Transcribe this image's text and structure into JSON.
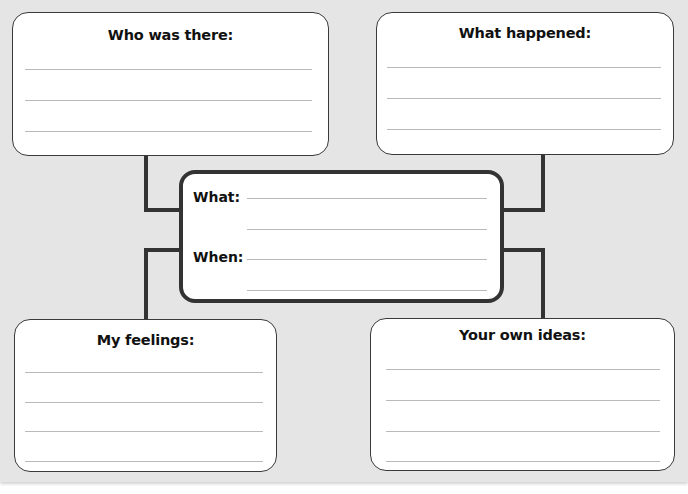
{
  "diagram": {
    "type": "graphic-organizer",
    "colors": {
      "background": "#e5e5e5",
      "box_fill": "#ffffff",
      "border": "#333333",
      "writing_line": "#b9b9b9"
    },
    "center": {
      "what_label": "What:",
      "when_label": "When:",
      "lines_per_label": 2
    },
    "boxes": [
      {
        "position": "top-left",
        "title": "Who was there:",
        "lines": 3
      },
      {
        "position": "top-right",
        "title": "What happened:",
        "lines": 3
      },
      {
        "position": "bottom-left",
        "title": "My feelings:",
        "lines": 4
      },
      {
        "position": "bottom-right",
        "title": "Your own ideas:",
        "lines": 4
      }
    ]
  }
}
